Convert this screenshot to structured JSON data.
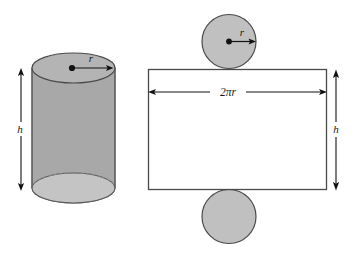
{
  "figure": {
    "background_color": "#ffffff",
    "stroke_color": "#5a5a5a",
    "dark_stroke_color": "#4a4a4a",
    "text_color": "#1a1a1a",
    "cylinder_body_color": "#a8a8a8",
    "cylinder_top_color": "#b4b4b4",
    "cylinder_bottom_color": "#c4c4c4",
    "circle_fill_color": "#c0c0c0",
    "rectangle_fill_color": "#ffffff"
  },
  "left_diagram": {
    "name": "cylinder",
    "height_label": "h",
    "radius_label": "r"
  },
  "right_diagram": {
    "name": "cylinder-net",
    "top_circle_radius_label": "r",
    "circumference_label": "2πr",
    "height_label": "h"
  }
}
